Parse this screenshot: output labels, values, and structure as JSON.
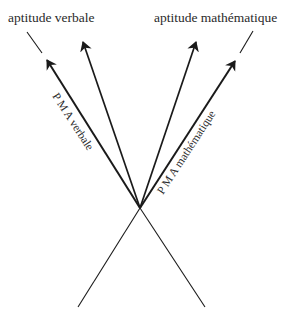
{
  "diagram": {
    "axes": {
      "verbal": {
        "label": "aptitude verbale"
      },
      "math": {
        "label": "aptitude mathématique"
      }
    },
    "vectors": {
      "pma_verbal": {
        "label": "P M A  verbale"
      },
      "pma_math": {
        "label": "P M A  mathématique"
      }
    },
    "colors": {
      "line": "#1a1a1a",
      "text": "#2a2a2a",
      "background": "#ffffff"
    }
  }
}
